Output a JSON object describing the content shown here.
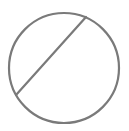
{
  "icon": {
    "name": "no-entry-circle-slash",
    "stroke_color": "#7a7a7a",
    "background": "#ffffff",
    "circle": {
      "cx": 64,
      "cy": 68,
      "r": 55
    },
    "slash": {
      "x1": 86,
      "y1": 17,
      "x2": 16,
      "y2": 95
    },
    "stroke_width": 2.2
  }
}
